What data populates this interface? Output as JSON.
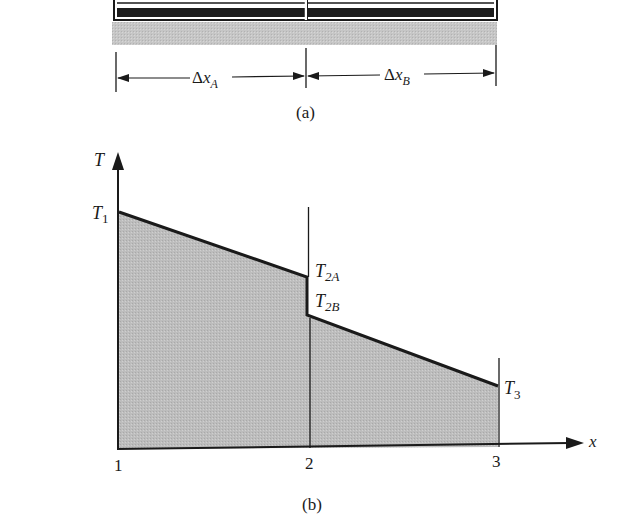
{
  "figure_a": {
    "caption": "(a)",
    "dimension_labels": {
      "left": {
        "delta": "Δ",
        "var": "x",
        "sub": "A"
      },
      "right": {
        "delta": "Δ",
        "var": "x",
        "sub": "B"
      }
    }
  },
  "figure_b": {
    "caption": "(b)",
    "y_axis_label": "T",
    "x_axis_label": "x",
    "x_ticks": [
      "1",
      "2",
      "3"
    ],
    "point_labels": {
      "t1": {
        "base": "T",
        "sub": "1"
      },
      "t2a": {
        "base": "T",
        "sub": "2A"
      },
      "t2b": {
        "base": "T",
        "sub": "2B"
      },
      "t3": {
        "base": "T",
        "sub": "3"
      }
    }
  },
  "colors": {
    "ink": "#1a1a1a",
    "fill_gray": "#b8b8b8",
    "band_gray": "#c4c4c4",
    "stripe_dark": "#1c1c1c"
  }
}
